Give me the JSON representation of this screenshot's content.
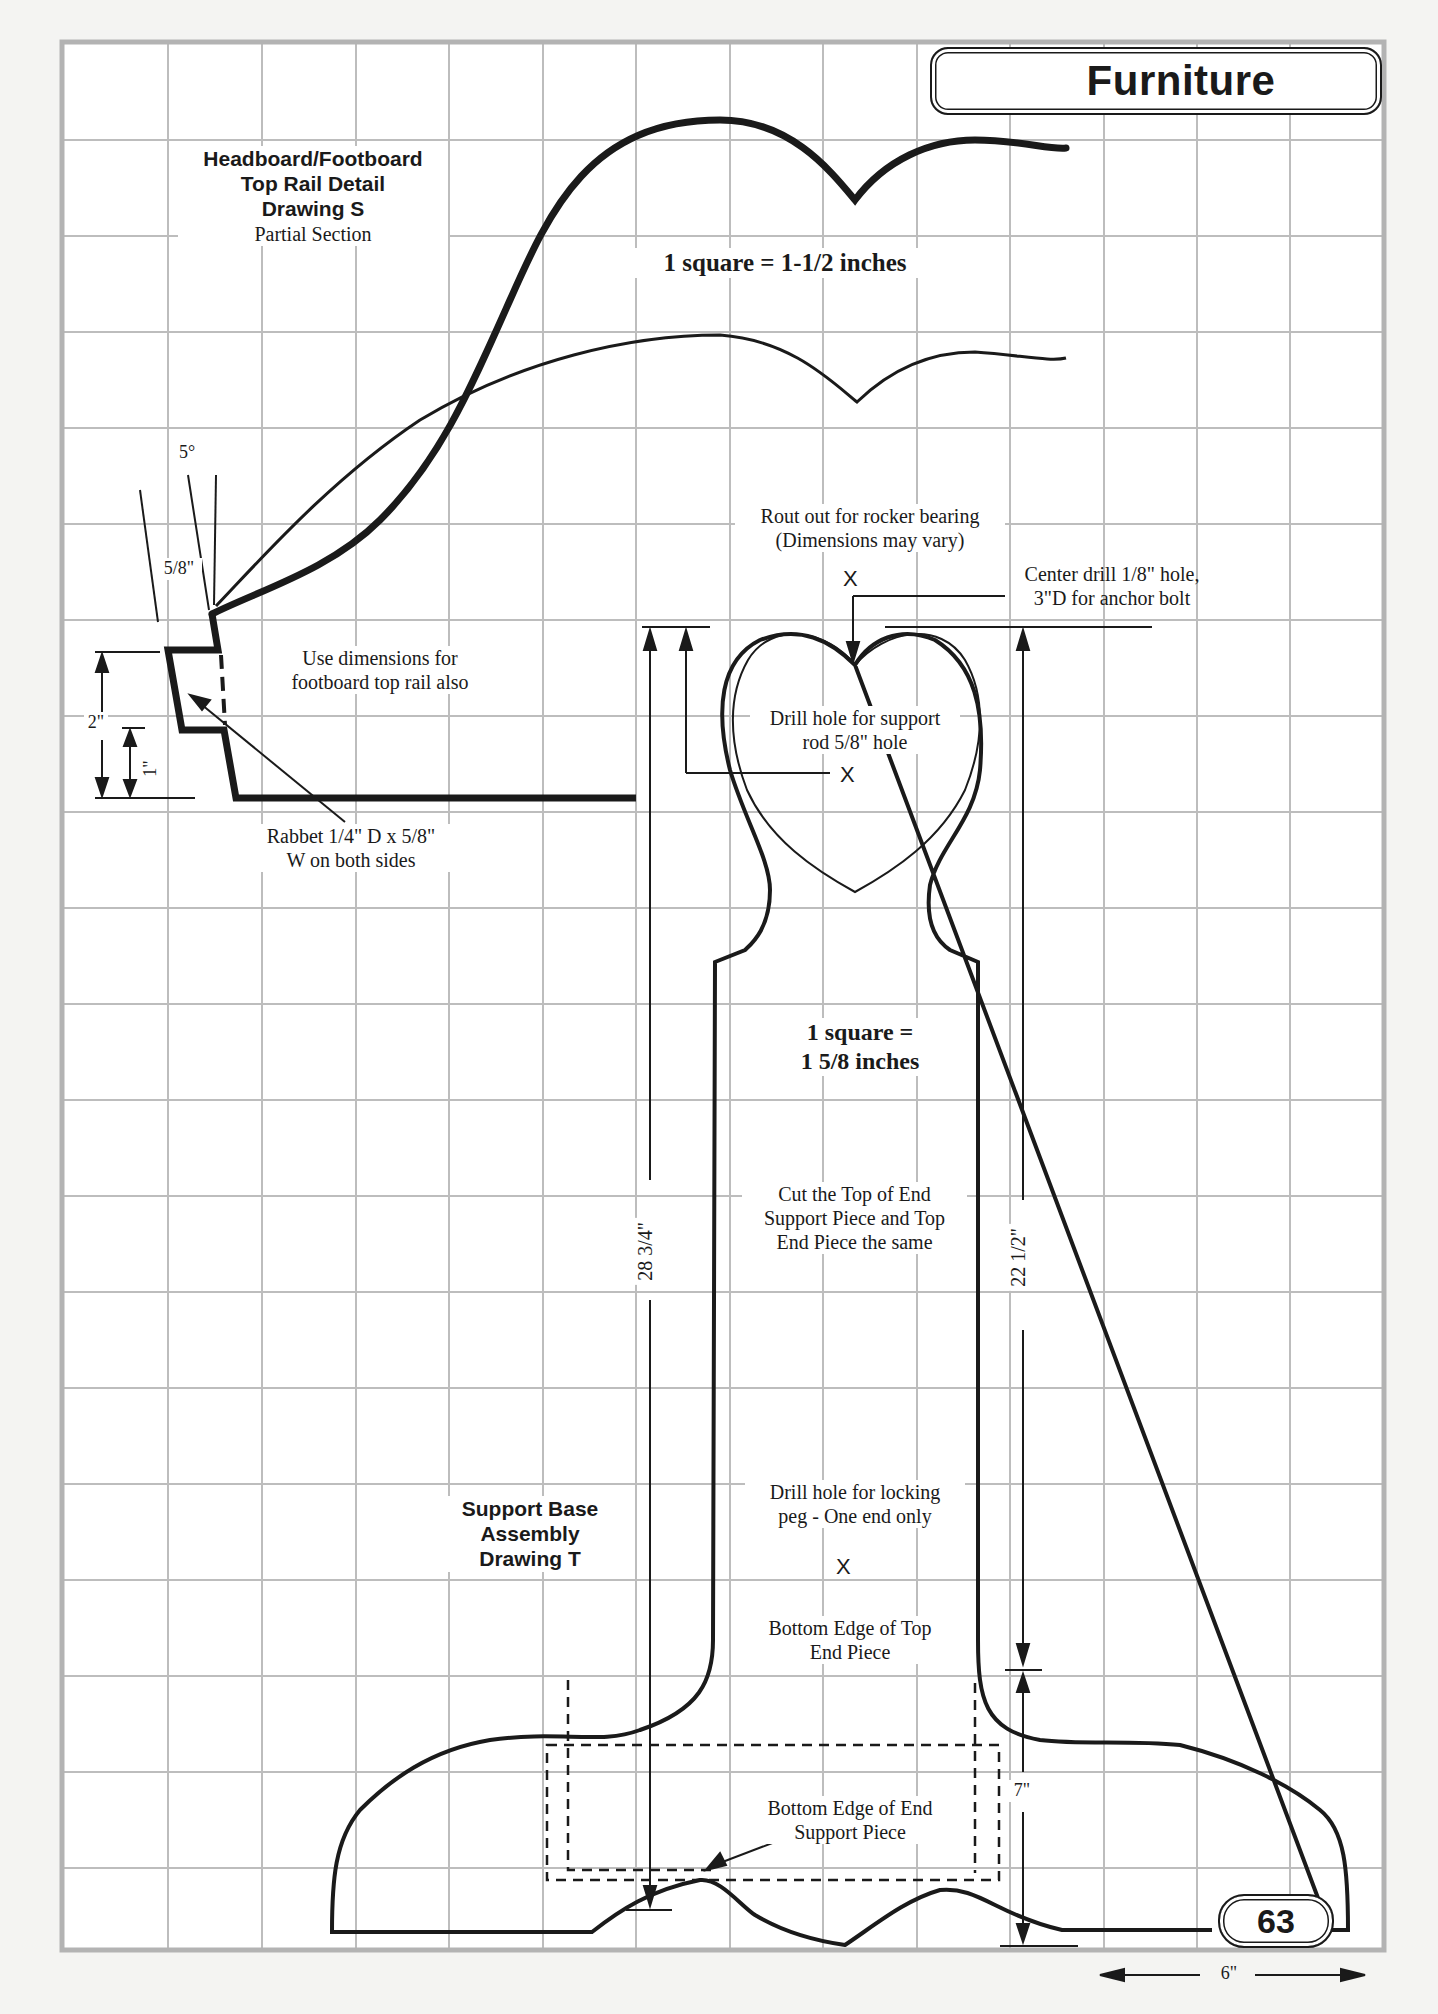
{
  "header": {
    "section_title": "Furniture"
  },
  "footer": {
    "page_number": "63",
    "bottom_dimension": "6\""
  },
  "drawing_s": {
    "title_lines": [
      "Headboard/Footboard",
      "Top Rail Detail",
      "Drawing S"
    ],
    "subtitle": "Partial Section",
    "scale_note": "1 square = 1-1/2 inches",
    "angle_label": "5°",
    "thickness_label": "5/8\"",
    "height_outer_label": "2\"",
    "height_inner_label": "1\"",
    "note_footboard": [
      "Use dimensions for",
      "footboard top rail also"
    ],
    "note_rabbet": [
      "Rabbet 1/4\" D x 5/8\"",
      "W on both sides"
    ]
  },
  "drawing_t": {
    "title_lines": [
      "Support Base",
      "Assembly",
      "Drawing T"
    ],
    "scale_note_lines": [
      "1 square =",
      "1 5/8 inches"
    ],
    "note_rocker": [
      "Rout out for rocker bearing",
      "(Dimensions may vary)"
    ],
    "note_center_drill": [
      "Center drill 1/8\" hole,",
      "3\"D for anchor bolt"
    ],
    "note_support_rod": [
      "Drill hole for support",
      "rod 5/8\" hole"
    ],
    "note_cut_top": [
      "Cut the Top of End",
      "Support Piece and Top",
      "End Piece the same"
    ],
    "note_locking_peg": [
      "Drill hole for locking",
      "peg - One end only"
    ],
    "note_bottom_top": [
      "Bottom Edge of Top",
      "End Piece"
    ],
    "note_bottom_support": [
      "Bottom Edge of End",
      "Support Piece"
    ],
    "dim_left": "28 3/4\"",
    "dim_right": "22 1/2\"",
    "dim_base": "7\"",
    "mark_symbol": "X"
  },
  "colors": {
    "grid": "#bdbdbd",
    "ink": "#1a1a1a",
    "paper": "#ffffff"
  }
}
